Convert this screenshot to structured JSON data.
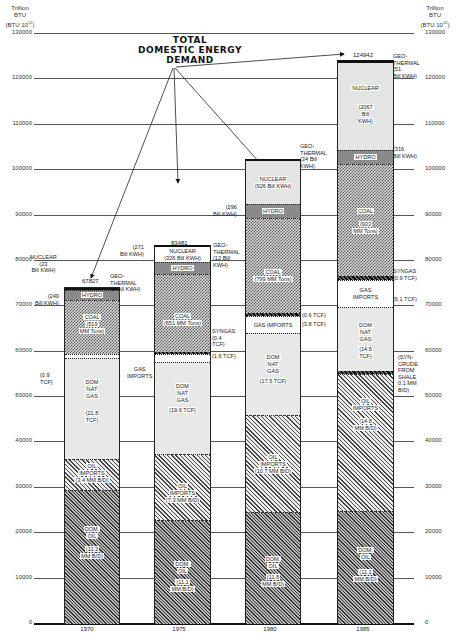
{
  "chart_data": {
    "type": "bar",
    "stacked": true,
    "title": "TOTAL DOMESTIC ENERGY DEMAND",
    "ylabel": "Trillion BTU (BTU 10^12)",
    "xlabel": "",
    "ylim": [
      0,
      130000
    ],
    "yticks": [
      0,
      10000,
      20000,
      30000,
      40000,
      50000,
      60000,
      70000,
      80000,
      90000,
      100000,
      110000,
      120000,
      130000
    ],
    "grid": true,
    "categories": [
      "1970",
      "1975",
      "1980",
      "1985"
    ],
    "totals": [
      67827,
      83481,
      102581,
      124942
    ],
    "series": [
      {
        "name": "Dom. Oil",
        "values": [
          23000,
          22800,
          24000,
          23000
        ],
        "units": [
          "11.3 MM B/D",
          "11.1 MM B/D",
          "11.8 MM B/D",
          "11.1 MM B/D"
        ]
      },
      {
        "name": "Oil Imports",
        "values": [
          6800,
          14700,
          21500,
          30000
        ],
        "units": [
          "3.4 MM B/D",
          "7.3 MM B/D",
          "10.7 MM B/D",
          "14.8 MM B/D"
        ]
      },
      {
        "name": "Syncrude from Shale",
        "values": [
          0,
          0,
          0,
          300
        ],
        "units": [
          "",
          "",
          "",
          "0.1 MM B/D"
        ]
      },
      {
        "name": "Dom. Nat. Gas",
        "values": [
          22400,
          20300,
          18000,
          14900
        ],
        "units": [
          "21.8 TCF",
          "19.6 TCF",
          "17.5 TCF",
          "14.5 TCF"
        ]
      },
      {
        "name": "Gas Imports",
        "values": [
          900,
          1600,
          3900,
          6300
        ],
        "units": [
          "0.9 TCF",
          "1.6 TCF",
          "3.8 TCF",
          "6.1 TCF"
        ]
      },
      {
        "name": "Syngas",
        "values": [
          0,
          400,
          600,
          900
        ],
        "units": [
          "",
          "0.4 TCF",
          "0.6 TCF",
          "0.9 TCF"
        ]
      },
      {
        "name": "Coal",
        "values": [
          11900,
          14900,
          18300,
          21400
        ],
        "units": [
          "519 MM Tons",
          "651 MM Tons",
          "799 MM Tons",
          "933 MM Tons"
        ]
      },
      {
        "name": "Hydro",
        "values": [
          2500,
          2800,
          3000,
          3200
        ],
        "units": [
          "249 Bill KWH",
          "271 Bill KWH",
          "296 Bill KWH",
          "316 Bill KWH"
        ]
      },
      {
        "name": "Nuclear",
        "values": [
          250,
          3400,
          9400,
          20700
        ],
        "units": [
          "23 Bill KWH",
          "326 Bill KWH",
          "926 Bill KWH",
          "2067 Bill KWH"
        ]
      },
      {
        "name": "Geothermal",
        "values": [
          77,
          100,
          300,
          542
        ],
        "units": [
          "1 Bill KWH",
          "12 Bill KWH",
          "34 Bill KWH",
          "51 Bill KWH"
        ]
      }
    ]
  },
  "axis": {
    "left_title": [
      "Trillion",
      "BTU",
      "(BTU 10",
      "12",
      ")"
    ],
    "right_title": [
      "Trillion",
      "BTU",
      "(BTU 10",
      "12",
      ")"
    ],
    "ticks": [
      "130000",
      "120000",
      "110000",
      "100000",
      "90000",
      "80000",
      "70000",
      "60000",
      "50000",
      "40000",
      "30000",
      "20000",
      "10000",
      "0"
    ]
  },
  "title_lines": [
    "TOTAL",
    "DOMESTIC ENERGY",
    "DEMAND"
  ],
  "years": [
    "1970",
    "1975",
    "1980",
    "1985"
  ],
  "totals": [
    "67827",
    "83481",
    "102581",
    "124942"
  ],
  "bars": {
    "b1970": {
      "domoil": [
        "DOM.",
        "OIL",
        "(11.3",
        "MM B/D)"
      ],
      "oilimp": [
        "OIL",
        "IMPORTS",
        "(3.4 MM B/D)"
      ],
      "natgas": [
        "DOM",
        "NAT",
        "GAS",
        "(21.8",
        "TCF)"
      ],
      "coal": [
        "COAL",
        "(519",
        "MM Tons)"
      ],
      "hydro": "HYDRO",
      "ann_nuclear": "NUCLEAR\n(23\nBill KWH)",
      "ann_geo": "GEO-\nTHERMAL\n(1 Bill KWH)",
      "ann_hydro": "(249\nBill KWH)",
      "ann_gasimp_val": "(0.9\nTCF)",
      "ann_gasimp": "GAS\nIMPORTS"
    },
    "b1975": {
      "domoil": [
        "DOM.",
        "OIL",
        "(11.1",
        "MM B/D)"
      ],
      "oilimp": [
        "OIL",
        "IMPORTS",
        "(7.3 MM B/D)"
      ],
      "natgas": [
        "DOM",
        "NAT",
        "GAS",
        "(19.6 TCF)"
      ],
      "coal": [
        "COAL",
        "(651 MM Tons)"
      ],
      "hydro": "HYDRO",
      "nuclear": [
        "NUCLEAR",
        "(326 Bill KWH)"
      ],
      "ann_hydro": "(271\nBill KWH)",
      "ann_geo": "GEO-\nTHERMAL\n(12 Bill\nKWH)",
      "ann_syngas": "SYNGAS\n(0.4\nTCF)",
      "ann_gasimp": "(1.6 TCF)"
    },
    "b1980": {
      "domoil": [
        "DOM.",
        "OIL",
        "(11.8",
        "MM B/D)"
      ],
      "oilimp": [
        "OIL",
        "IMPORTS",
        "(10.7 MM B/D)"
      ],
      "natgas": [
        "DOM",
        "NAT",
        "GAS",
        "(17.5 TCF)"
      ],
      "gasimp": "GAS IMPORTS",
      "coal": [
        "COAL",
        "(799 MM Tons)"
      ],
      "hydro": "HYDRO",
      "nuclear": [
        "NUCLEAR",
        "(926 Bill KWH)"
      ],
      "ann_hydro": "(296\nBill KWH)",
      "ann_geo": "GEO-\nTHERMAL\n(34 Bill\nKWH)",
      "ann_syngas": "(0.6 TCF)",
      "ann_gasimp": "(3.8 TCF)"
    },
    "b1985": {
      "domoil": [
        "DOM.",
        "OIL",
        "(11.1",
        "MM B/D)"
      ],
      "oilimp": [
        "OIL",
        "IMPORTS",
        "(14.8",
        "MM B/D)"
      ],
      "natgas": [
        "DOM",
        "NAT",
        "GAS",
        "(14.5",
        "TCF)"
      ],
      "gasimp": [
        "GAS",
        "IMPORTS"
      ],
      "coal": [
        "COAL",
        "(933",
        "MM Tons)"
      ],
      "hydro": "HYDRO",
      "nuclear": [
        "NUCLEAR",
        "(2067",
        "Bill",
        "KWH)"
      ],
      "ann_hydro": "(316\nBill KWH)",
      "ann_geo": "GEO-\nTHERMAL\n(51\nBill KWH)",
      "ann_syngas": "SYNGAS\n(0.9 TCF)",
      "ann_gasimp": "(6.1 TCF)",
      "ann_syncrude": "(SYN-\nCRUDE\nFROM\nSHALE\n0.1 MM\nB/D)"
    }
  }
}
